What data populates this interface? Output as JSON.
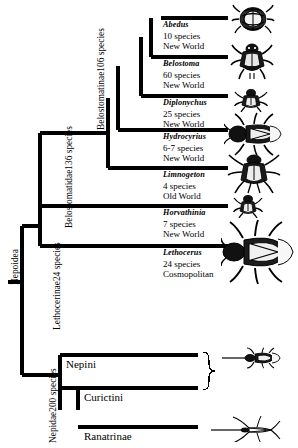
{
  "figure": {
    "type": "cladogram",
    "root_label": "Nepoidea"
  },
  "clade_labels": {
    "nepoidea": "Nepoidea",
    "belostomatidae_l1": "Belostomatidae",
    "belostomatidae_l2": "136 species",
    "belostomatinae_l1": "Belostomatinae",
    "belostomatinae_l2": "106 species",
    "lethocerinae_l1": "Lethocerinae",
    "lethocerinae_l2": "24 species",
    "nepidae_l1": "Nepidae",
    "nepidae_l2": "200 species"
  },
  "taxa": [
    {
      "genus": "Abedus",
      "species_count": "10 species",
      "distribution": "New World",
      "icon": "giant-water-bug-abedus-icon"
    },
    {
      "genus": "Belostoma",
      "species_count": "60 species",
      "distribution": "New World",
      "icon": "giant-water-bug-belostoma-icon"
    },
    {
      "genus": "Diplonychus",
      "species_count": "25 species",
      "distribution": "New World",
      "icon": "giant-water-bug-diplonychus-icon"
    },
    {
      "genus": "Hydrocyrius",
      "species_count": "6-7 species",
      "distribution": "New World",
      "icon": "giant-water-bug-hydrocyrius-icon"
    },
    {
      "genus": "Limnogeton",
      "species_count": "4 species",
      "distribution": "Old World",
      "icon": "giant-water-bug-limnogeton-icon"
    },
    {
      "genus": "Horvathinia",
      "species_count": "7 species",
      "distribution": "New World",
      "icon": "giant-water-bug-horvathinia-icon"
    },
    {
      "genus": "Lethocerus",
      "species_count": "24 species",
      "distribution": "Cosmopolitan",
      "icon": "giant-water-bug-lethocerus-icon"
    }
  ],
  "lower_taxa": [
    {
      "label": "Nepini",
      "icon": "water-scorpion-nepini-icon"
    },
    {
      "label": "Curictini",
      "icon": "water-scorpion-curictini-icon"
    },
    {
      "label": "Ranatrinae",
      "icon": "water-stick-insect-ranatra-icon"
    }
  ],
  "colors": {
    "ink": "#000000",
    "background": "#ffffff"
  }
}
